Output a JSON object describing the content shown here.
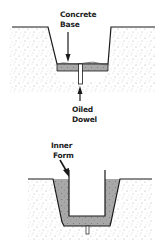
{
  "diagrams": [
    {
      "name": "concrete-base-stage",
      "labels": {
        "top_line1": "Concrete",
        "top_line2": "Base",
        "bottom_line1": "Oiled",
        "bottom_line2": "Dowel"
      }
    },
    {
      "name": "inner-form-stage",
      "labels": {
        "line1": "Inner",
        "line2": "Form"
      }
    }
  ],
  "colors": {
    "soil_dots": "#9a9a9a",
    "concrete": "#a8a8a8",
    "line": "#1a1a1a"
  }
}
